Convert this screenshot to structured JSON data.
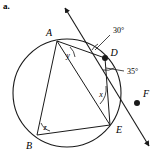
{
  "problem": {
    "part_label": "a."
  },
  "figure": {
    "type": "circle-geometry-diagram",
    "stroke_color": "#1a1a1a",
    "fill_color": "#ffffff",
    "circle": {
      "cx": 67,
      "cy": 93,
      "r": 54
    },
    "points": [
      {
        "name": "A",
        "label": "A",
        "x": 57,
        "y": 41,
        "label_x": 49,
        "label_y": 34,
        "marker": false
      },
      {
        "name": "D",
        "label": "D",
        "x": 105,
        "y": 58,
        "label_x": 112,
        "label_y": 54,
        "marker": true
      },
      {
        "name": "E",
        "label": "E",
        "x": 110,
        "y": 125,
        "label_x": 117,
        "label_y": 130,
        "marker": false
      },
      {
        "name": "B",
        "label": "B",
        "x": 37,
        "y": 135,
        "label_x": 28,
        "label_y": 146,
        "marker": false
      },
      {
        "name": "F",
        "label": "F",
        "x": 137,
        "y": 103,
        "label_x": 144,
        "label_y": 98,
        "marker": true
      }
    ],
    "chords": [
      {
        "name": "chord-AD",
        "from": "A",
        "to": "D"
      },
      {
        "name": "chord-AE",
        "from": "A",
        "to": "E"
      },
      {
        "name": "chord-AB",
        "from": "A",
        "to": "B"
      },
      {
        "name": "chord-DE",
        "from": "D",
        "to": "E"
      },
      {
        "name": "chord-BE",
        "from": "B",
        "to": "E"
      }
    ],
    "secant": {
      "name": "secant-line",
      "x1": 62,
      "y1": 5,
      "x2": 152,
      "y2": 150,
      "arrow_start": true,
      "arrow_end": true
    },
    "angles": [
      {
        "name": "angle-30-degrees",
        "label": "30°",
        "label_x": 113,
        "label_y": 30,
        "leader": true
      },
      {
        "name": "angle-35-degrees",
        "label": "35°",
        "label_x": 126,
        "label_y": 74,
        "leader": true
      },
      {
        "name": "angle-x",
        "label": "x",
        "label_x": 103,
        "label_y": 95
      },
      {
        "name": "angle-y",
        "label": "y",
        "label_x": 67,
        "label_y": 56
      },
      {
        "name": "angle-z",
        "label": "z",
        "label_x": 44,
        "label_y": 128
      }
    ]
  }
}
